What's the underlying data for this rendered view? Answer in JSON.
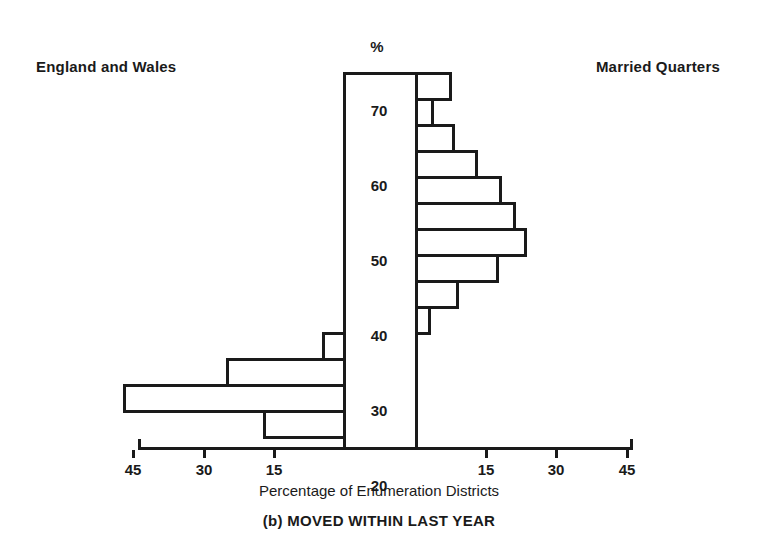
{
  "titles": {
    "left_panel": "England and Wales",
    "right_panel": "Married Quarters",
    "percent_axis": "%",
    "x_axis": "Percentage of Enumeration Districts",
    "caption": "(b)  MOVED WITHIN LAST YEAR"
  },
  "chart_data": {
    "type": "bar",
    "title": "(b) MOVED WITHIN LAST YEAR",
    "subtype": "back-to-back horizontal histogram (population pyramid)",
    "xlabel": "Percentage of Enumeration Districts",
    "ylabel": "%",
    "grid": false,
    "legend_position": "panel-headers",
    "xlim": [
      -45,
      45
    ],
    "ylim": [
      25,
      75
    ],
    "x_tick_labels_left": [
      "45",
      "30",
      "15"
    ],
    "x_tick_labels_right": [
      "15",
      "30",
      "45"
    ],
    "x_tick_values": [
      45,
      30,
      15,
      15,
      30,
      45
    ],
    "y_tick_labels": [
      "70",
      "60",
      "50",
      "40",
      "30",
      "20",
      "10"
    ],
    "y_tick_values": [
      70,
      60,
      50,
      40,
      30,
      20,
      10
    ],
    "bin_width": 5,
    "categories": [
      "70-75",
      "65-70",
      "60-65",
      "55-60",
      "50-55",
      "45-50",
      "40-45",
      "35-40",
      "30-35",
      "25-30",
      "20-25",
      "15-20",
      "10-15",
      "5-10",
      "0-5"
    ],
    "series": [
      {
        "name": "England and Wales",
        "direction": "left",
        "values": [
          0,
          0,
          0,
          0,
          0,
          0,
          0,
          0,
          0,
          0,
          4.5,
          25,
          47,
          17,
          0
        ]
      },
      {
        "name": "Married Quarters",
        "direction": "right",
        "values": [
          8,
          4,
          8.5,
          13.5,
          18.5,
          21.5,
          24,
          18,
          9.5,
          3.5,
          0,
          0,
          0,
          0,
          0
        ]
      }
    ]
  },
  "geometry": {
    "plot_top": 72,
    "plot_bottom": 447,
    "centre_left": 343,
    "centre_right": 415,
    "row_height": 26,
    "rows": 15,
    "px_per_unit": 4.68,
    "axis_left": 138,
    "axis_right": 630,
    "axis_y": 447
  },
  "colors": {
    "ink": "#1a1a1a",
    "paper": "#ffffff"
  }
}
